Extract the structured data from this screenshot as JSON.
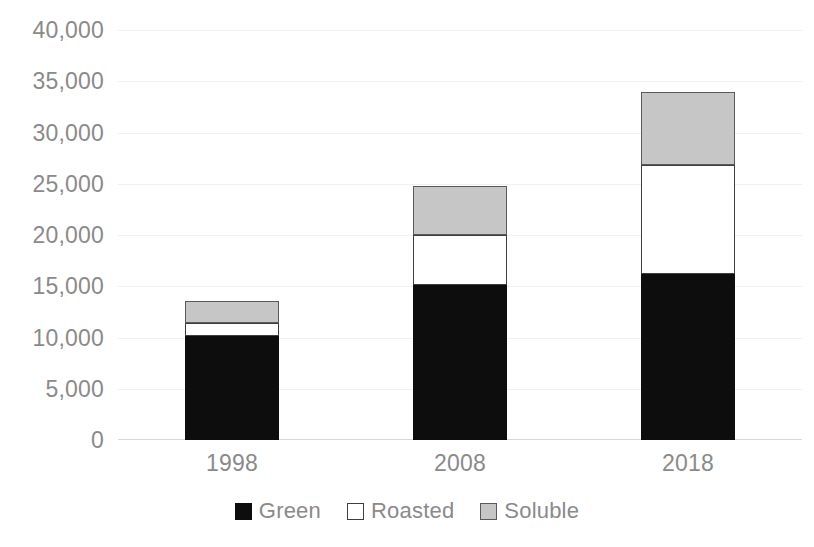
{
  "chart_data": {
    "type": "bar",
    "subtype": "stacked-column",
    "title": "",
    "subtitle": "",
    "xlabel": "",
    "ylabel": "",
    "categories": [
      "1998",
      "2008",
      "2018"
    ],
    "series": [
      {
        "name": "Green",
        "values": [
          10100,
          15100,
          16200
        ],
        "color": "#0d0d0d"
      },
      {
        "name": "Roasted",
        "values": [
          1300,
          4900,
          10600
        ],
        "color": "#ffffff"
      },
      {
        "name": "Soluble",
        "values": [
          2200,
          4800,
          7200
        ],
        "color": "#c6c6c6"
      }
    ],
    "totals": [
      13600,
      24800,
      34000
    ],
    "ylim": [
      0,
      40000
    ],
    "ytick_step": 5000,
    "ytick_labels": [
      "40,000",
      "35,000",
      "30,000",
      "25,000",
      "20,000",
      "15,000",
      "10,000",
      "5,000",
      "0"
    ],
    "ytick_values": [
      40000,
      35000,
      30000,
      25000,
      20000,
      15000,
      10000,
      5000,
      0
    ],
    "grid": true,
    "grid_color": "#f0f0f0",
    "legend_position": "bottom",
    "legend": [
      "Green",
      "Roasted",
      "Soluble"
    ],
    "axis_text_color": "#8a8a8a",
    "background": "#ffffff"
  },
  "legend_items": [
    {
      "label": "Green",
      "swatch": "green-swatch"
    },
    {
      "label": "Roasted",
      "swatch": "roasted-swatch"
    },
    {
      "label": "Soluble",
      "swatch": "soluble-swatch"
    }
  ]
}
